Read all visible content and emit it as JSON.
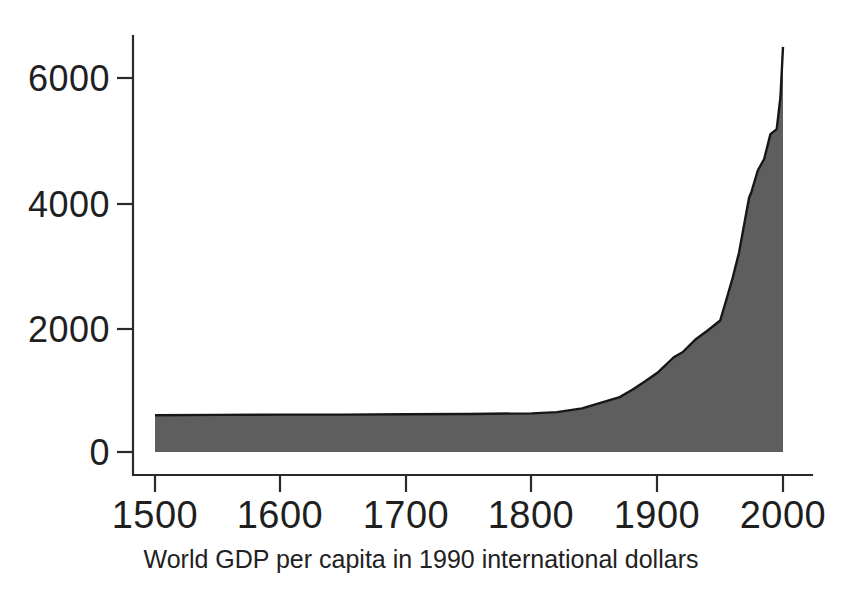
{
  "figure": {
    "background_color": "#ffffff",
    "caption": "World GDP per capita in 1990 international dollars"
  },
  "chart_data": {
    "type": "area",
    "title": "",
    "subtitle": "",
    "xlabel": "",
    "ylabel": "",
    "annotations": [],
    "legend": {
      "visible": false,
      "position": "none",
      "entries": []
    },
    "grid": false,
    "xlim": [
      1500,
      2000
    ],
    "ylim": [
      0,
      6600
    ],
    "xticks": [
      1500,
      1600,
      1700,
      1800,
      1900,
      2000
    ],
    "xtick_labels": [
      "1500",
      "1600",
      "1700",
      "1800",
      "1900",
      "2000"
    ],
    "yticks": [
      0,
      2000,
      4000,
      6000
    ],
    "ytick_labels": [
      "0",
      "2000",
      "4000",
      "6000"
    ],
    "series_color": "#5e5e5e",
    "line_color": "#171717",
    "units": "1990 international dollars per capita",
    "x": [
      1500,
      1550,
      1600,
      1650,
      1700,
      1750,
      1800,
      1820,
      1840,
      1850,
      1860,
      1870,
      1880,
      1890,
      1900,
      1913,
      1920,
      1930,
      1940,
      1950,
      1955,
      1960,
      1965,
      1970,
      1973,
      1975,
      1980,
      1985,
      1990,
      1995,
      1998,
      2000
    ],
    "values": [
      590,
      595,
      600,
      600,
      605,
      610,
      620,
      640,
      700,
      760,
      820,
      880,
      1000,
      1130,
      1270,
      1520,
      1600,
      1800,
      1950,
      2110,
      2450,
      2800,
      3200,
      3750,
      4080,
      4180,
      4520,
      4700,
      5100,
      5180,
      5700,
      6500
    ]
  }
}
